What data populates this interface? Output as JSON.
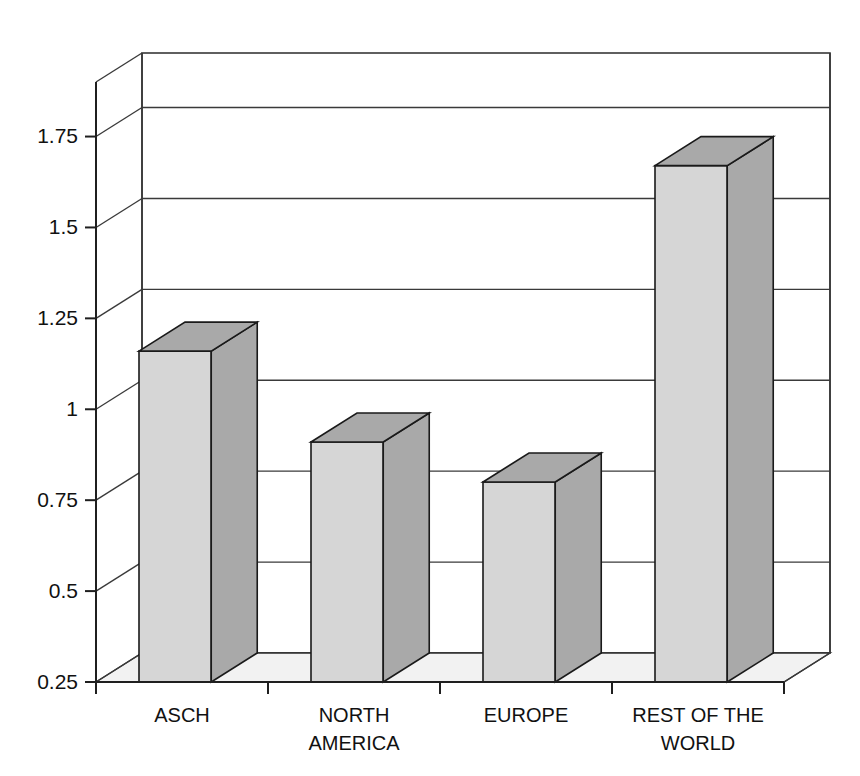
{
  "chart_data": {
    "type": "bar",
    "title": "",
    "subtitle": "",
    "xlabel": "",
    "ylabel": "",
    "categories": [
      "ASCH",
      "NORTH AMERICA",
      "EUROPE",
      "REST OF THE WORLD"
    ],
    "category_lines": [
      [
        "ASCH"
      ],
      [
        "NORTH",
        "AMERICA"
      ],
      [
        "EUROPE"
      ],
      [
        "REST OF THE",
        "WORLD"
      ]
    ],
    "values": [
      1.16,
      0.91,
      0.8,
      1.67
    ],
    "ylim": [
      0.25,
      1.9
    ],
    "ytick_labels": [
      "0.25",
      "0.5",
      "0.75",
      "1",
      "1.25",
      "1.5",
      "1.75"
    ],
    "ytick_values": [
      0.25,
      0.5,
      0.75,
      1,
      1.25,
      1.5,
      1.75
    ],
    "grid": true,
    "legend": "none",
    "style": "3d-columns",
    "series": [
      {
        "name": "series-1",
        "values": [
          1.16,
          0.91,
          0.8,
          1.67
        ]
      }
    ]
  },
  "colors": {
    "bar_front": "#d6d6d6",
    "bar_side": "#a9a9a9",
    "bar_top": "#a9a9a9",
    "floor": "#f2f2f2",
    "wall": "#ffffff",
    "outline": "#1a1a1a",
    "grid": "#3a3a3a",
    "text": "#111111",
    "background": "#ffffff"
  }
}
